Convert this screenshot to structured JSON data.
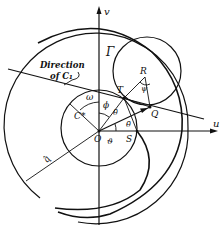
{
  "diagram": {
    "type": "geometric construction (hodograph / velocity-plane diagram)",
    "axes": {
      "horizontal_label": "u",
      "vertical_label": "v"
    },
    "labels": {
      "direction_line1": "Direction",
      "direction_line2": "of C₁",
      "gamma": "Γ",
      "omega": "ω",
      "R": "R",
      "psi": "ψ",
      "T": "T",
      "phi": "ϕ",
      "Q": "Q",
      "theta_bar": "θ̄",
      "C_star": "C*",
      "O": "O",
      "vartheta": "ϑ",
      "S": "S",
      "q_hat": "q̂"
    },
    "points": [
      "O",
      "S",
      "Q",
      "T",
      "R"
    ],
    "circles": [
      {
        "name": "outer-circle"
      },
      {
        "name": "gamma-curve"
      },
      {
        "name": "sonic-circle",
        "label": "C*"
      },
      {
        "name": "circle-RTQ"
      },
      {
        "name": "inner-arc-through-S"
      }
    ]
  }
}
